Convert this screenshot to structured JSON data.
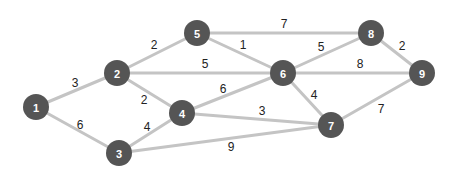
{
  "diagram": {
    "type": "weighted-undirected-graph",
    "colors": {
      "node_fill": "#555555",
      "node_text": "#ffffff",
      "edge": "#c4c4c4",
      "edge_label": "#222222",
      "background": "#ffffff"
    },
    "node_radius": 13,
    "nodes": [
      {
        "id": "1",
        "label": "1",
        "x": 36,
        "y": 107
      },
      {
        "id": "2",
        "label": "2",
        "x": 117,
        "y": 73
      },
      {
        "id": "3",
        "label": "3",
        "x": 119,
        "y": 153
      },
      {
        "id": "4",
        "label": "4",
        "x": 182,
        "y": 113
      },
      {
        "id": "5",
        "label": "5",
        "x": 197,
        "y": 33
      },
      {
        "id": "6",
        "label": "6",
        "x": 283,
        "y": 73
      },
      {
        "id": "7",
        "label": "7",
        "x": 331,
        "y": 125
      },
      {
        "id": "8",
        "label": "8",
        "x": 371,
        "y": 33
      },
      {
        "id": "9",
        "label": "9",
        "x": 422,
        "y": 73
      }
    ],
    "edges": [
      {
        "from": "1",
        "to": "2",
        "weight": "3",
        "lx": 75,
        "ly": 83
      },
      {
        "from": "1",
        "to": "3",
        "weight": "6",
        "lx": 80,
        "ly": 125
      },
      {
        "from": "2",
        "to": "5",
        "weight": "2",
        "lx": 154,
        "ly": 45
      },
      {
        "from": "2",
        "to": "6",
        "weight": "5",
        "lx": 205,
        "ly": 64
      },
      {
        "from": "2",
        "to": "4",
        "weight": "2",
        "lx": 144,
        "ly": 100
      },
      {
        "from": "3",
        "to": "4",
        "weight": "4",
        "lx": 147,
        "ly": 127
      },
      {
        "from": "3",
        "to": "7",
        "weight": "9",
        "lx": 231,
        "ly": 147
      },
      {
        "from": "4",
        "to": "6",
        "weight": "6",
        "lx": 223,
        "ly": 89
      },
      {
        "from": "4",
        "to": "7",
        "weight": "3",
        "lx": 262,
        "ly": 111
      },
      {
        "from": "5",
        "to": "8",
        "weight": "7",
        "lx": 284,
        "ly": 24
      },
      {
        "from": "5",
        "to": "6",
        "weight": "1",
        "lx": 243,
        "ly": 45
      },
      {
        "from": "6",
        "to": "8",
        "weight": "5",
        "lx": 321,
        "ly": 47
      },
      {
        "from": "6",
        "to": "9",
        "weight": "8",
        "lx": 360,
        "ly": 64
      },
      {
        "from": "6",
        "to": "7",
        "weight": "4",
        "lx": 314,
        "ly": 95
      },
      {
        "from": "8",
        "to": "9",
        "weight": "2",
        "lx": 402,
        "ly": 46
      },
      {
        "from": "7",
        "to": "9",
        "weight": "7",
        "lx": 381,
        "ly": 109
      }
    ]
  }
}
